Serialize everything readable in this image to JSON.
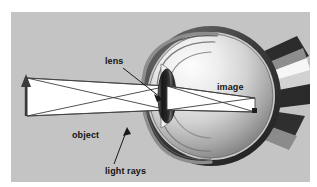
{
  "figure": {
    "type": "optics-diagram",
    "background_color": "#c4c4c4",
    "border_color": "#ffffff"
  },
  "labels": {
    "lens": "lens",
    "object": "object",
    "light_rays": "light rays",
    "image": "image"
  },
  "diagram": {
    "object_arrow": {
      "name": "object-arrow",
      "orientation": "up",
      "color": "#3a3a3a"
    },
    "light_beam": {
      "name": "light-beam",
      "fill": "#ffffff",
      "stroke": "#4a4a4a"
    },
    "lens_element": {
      "name": "eye-lens",
      "shape": "biconvex-ellipse",
      "fill": "#2a2a2a"
    },
    "eyeball": {
      "name": "eyeball-sphere",
      "highlight_color": "#f2f2f2",
      "shadow_color": "#6e6e6e",
      "sclera_ring_color": "#3a3a3a"
    },
    "optic_nerve": {
      "name": "optic-nerve",
      "band_colors": [
        "#2e2e2e",
        "#ffffff",
        "#8a8a8a"
      ]
    },
    "retinal_image": {
      "name": "retinal-image-beam",
      "fill": "#ffffff",
      "stroke": "#3a3a3a",
      "inverted": true
    }
  }
}
